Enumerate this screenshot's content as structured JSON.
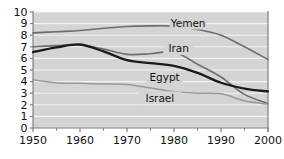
{
  "chart_data": {
    "type": "line",
    "title": "",
    "subtitle": "",
    "xlabel": "",
    "ylabel": "",
    "xlim": [
      1950,
      2000
    ],
    "ylim": [
      0,
      10
    ],
    "grid": "horizontal",
    "legend_position": "inline-labels",
    "plot_background": "#d4d4d4",
    "gridline_color": "#f2f2f2",
    "axis_color": "#808080",
    "x_ticks": [
      1950,
      1960,
      1970,
      1980,
      1990,
      2000
    ],
    "x_tick_labels": [
      "1950",
      "1960",
      "1970",
      "1980",
      "1990",
      "2000"
    ],
    "x_minor_ticks": [
      1955,
      1965,
      1975,
      1985,
      1995
    ],
    "y_ticks": [
      0,
      1,
      2,
      3,
      4,
      5,
      6,
      7,
      8,
      9,
      10
    ],
    "y_tick_labels": [
      "0",
      "1",
      "2",
      "3",
      "4",
      "5",
      "6",
      "7",
      "8",
      "9",
      "10"
    ],
    "x": [
      1950,
      1955,
      1960,
      1965,
      1970,
      1975,
      1980,
      1985,
      1990,
      1995,
      2000
    ],
    "series": [
      {
        "name": "Yemen",
        "color": "#6e6e6e",
        "width": 1.6,
        "label_x": 1983,
        "label_y": 9.05,
        "values": [
          8.2,
          8.3,
          8.4,
          8.6,
          8.75,
          8.8,
          8.78,
          8.5,
          8.0,
          7.0,
          5.9
        ]
      },
      {
        "name": "Iran",
        "color": "#6e6e6e",
        "width": 1.6,
        "label_x": 1981,
        "label_y": 6.85,
        "values": [
          7.0,
          7.1,
          7.15,
          6.8,
          6.35,
          6.4,
          6.55,
          5.5,
          4.4,
          2.9,
          2.1
        ]
      },
      {
        "name": "Egypt",
        "color": "#1a1a1a",
        "width": 2.3,
        "label_x": 1978,
        "label_y": 4.35,
        "values": [
          6.55,
          6.95,
          7.2,
          6.6,
          5.85,
          5.6,
          5.35,
          4.75,
          3.9,
          3.4,
          3.15
        ]
      },
      {
        "name": "Israel",
        "color": "#9a9a9a",
        "width": 1.5,
        "label_x": 1977,
        "label_y": 2.6,
        "values": [
          4.15,
          3.9,
          3.85,
          3.8,
          3.75,
          3.45,
          3.15,
          3.0,
          2.95,
          2.35,
          2.05
        ]
      }
    ]
  }
}
